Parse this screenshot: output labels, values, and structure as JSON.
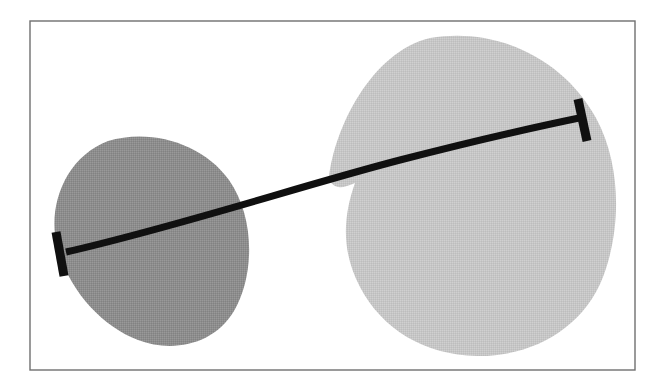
{
  "figure": {
    "canvas": {
      "width": 665,
      "height": 390,
      "background": "#ffffff"
    },
    "frame": {
      "name": "outer-border",
      "x": 30,
      "y": 21,
      "width": 605,
      "height": 349,
      "stroke": "#6f6f6f",
      "stroke_width": 1.4,
      "fill": "none"
    },
    "shapes": [
      {
        "id": "left-blob",
        "label": "left region",
        "fill": "#8d8d8d",
        "role": "region",
        "bbox": {
          "x": 51,
          "y": 136,
          "width": 201,
          "height": 210
        },
        "path": "M 108 141 C 150 128 203 143 229 180 C 256 219 254 277 234 311 C 214 345 172 353 138 340 C 101 326 68 289 57 246 C 47 205 66 157 108 141 Z"
      },
      {
        "id": "right-blob",
        "label": "right region",
        "fill": "#c6c6c6",
        "role": "region",
        "bbox": {
          "x": 328,
          "y": 36,
          "width": 288,
          "height": 320
        },
        "path": "M 430 38 C 500 26 566 62 596 118 C 622 166 621 230 603 277 C 583 329 531 357 477 356 C 424 355 382 329 360 287 C 340 249 344 214 355 183 C 340 190 332 188 329 178 C 334 129 371 52 430 38 Z"
      }
    ],
    "connector": {
      "id": "curved-connector",
      "label": "curved link",
      "stroke": "#101010",
      "stroke_width": 7,
      "path": "M 66 252 C 180 226 300 186 400 160 C 470 142 540 126 584 117",
      "endcaps": [
        {
          "id": "left-endcap",
          "label": "left bar cap",
          "x1": 56,
          "y1": 232,
          "x2": 64,
          "y2": 276,
          "stroke": "#101010",
          "stroke_width": 9
        },
        {
          "id": "right-endcap",
          "label": "right bar cap",
          "x1": 578,
          "y1": 99,
          "x2": 587,
          "y2": 141,
          "stroke": "#101010",
          "stroke_width": 9
        }
      ]
    },
    "palette": {
      "background": "#ffffff",
      "frame_stroke": "#6f6f6f",
      "left_region_fill": "#8d8d8d",
      "right_region_fill": "#c6c6c6",
      "connector_stroke": "#101010"
    }
  }
}
